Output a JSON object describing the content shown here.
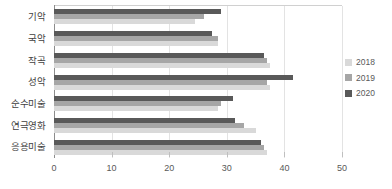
{
  "chart_data": {
    "type": "bar",
    "orientation": "horizontal",
    "title": "",
    "xlabel": "",
    "ylabel": "",
    "categories": [
      "기악",
      "국악",
      "작곡",
      "성악",
      "순수미술",
      "연극영화",
      "응용미술"
    ],
    "series": [
      {
        "name": "2018",
        "color": "#d9d9d9",
        "values": [
          24.5,
          28.5,
          37.5,
          37.5,
          28.5,
          35.0,
          37.0
        ]
      },
      {
        "name": "2019",
        "color": "#a6a6a6",
        "values": [
          26.0,
          28.5,
          37.0,
          37.0,
          29.0,
          33.0,
          36.5
        ]
      },
      {
        "name": "2020",
        "color": "#595959",
        "values": [
          29.0,
          27.5,
          36.5,
          41.5,
          31.0,
          31.5,
          36.0
        ]
      }
    ],
    "xticks": [
      0,
      10,
      20,
      30,
      40,
      50
    ],
    "xlim": [
      0,
      50
    ],
    "grid": true,
    "legend_position": "right"
  },
  "legend": {
    "items": [
      {
        "label": "2018",
        "color": "#d9d9d9"
      },
      {
        "label": "2019",
        "color": "#a6a6a6"
      },
      {
        "label": "2020",
        "color": "#595959"
      }
    ]
  }
}
